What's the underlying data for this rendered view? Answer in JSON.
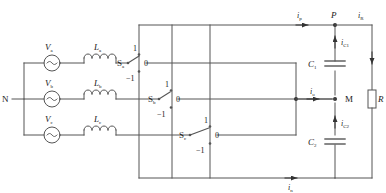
{
  "diagram": {
    "type": "electrical-schematic",
    "stroke_color": "#555555",
    "text_color": "#1a1a1a",
    "background": "#ffffff"
  },
  "source": {
    "neutral_label": "N",
    "phases": [
      {
        "source_label": "V",
        "source_sub": "a",
        "inductor_label": "L",
        "inductor_sub": "a",
        "symbol": "~"
      },
      {
        "source_label": "V",
        "source_sub": "b",
        "inductor_label": "L",
        "inductor_sub": "b",
        "symbol": "~"
      },
      {
        "source_label": "V",
        "source_sub": "c",
        "inductor_label": "L",
        "inductor_sub": "c",
        "symbol": "~"
      }
    ]
  },
  "switches": [
    {
      "name": "S",
      "sub": "a",
      "pos_up": "1",
      "pos_mid": "0",
      "pos_down": "−1"
    },
    {
      "name": "S",
      "sub": "b",
      "pos_up": "1",
      "pos_mid": "0",
      "pos_down": "−1"
    },
    {
      "name": "S",
      "sub": "c",
      "pos_up": "1",
      "pos_mid": "0",
      "pos_down": "−1"
    }
  ],
  "dc_side": {
    "node_p": "P",
    "node_m": "M",
    "capacitors": [
      {
        "label": "C",
        "sub": "1"
      },
      {
        "label": "C",
        "sub": "2"
      }
    ],
    "resistor": {
      "label": "R"
    },
    "currents": [
      {
        "label": "i",
        "sub": "p",
        "name": "current-ip"
      },
      {
        "label": "i",
        "sub": "R",
        "name": "current-iR"
      },
      {
        "label": "i",
        "sub": "C1",
        "name": "current-ic1"
      },
      {
        "label": "i",
        "sub": "o",
        "name": "current-io"
      },
      {
        "label": "i",
        "sub": "C2",
        "name": "current-ic2"
      },
      {
        "label": "i",
        "sub": "n",
        "name": "current-in"
      }
    ]
  }
}
